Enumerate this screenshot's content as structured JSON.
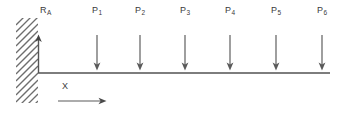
{
  "diagram": {
    "type": "cantilever-beam-free-body-diagram",
    "colors": {
      "line": "#7d7d7d",
      "hatch": "#6e6e6e",
      "arrow": "#666666",
      "text": "#3a3a3a",
      "background": "#ffffff"
    },
    "beam": {
      "label": "beam",
      "x_start": 38,
      "x_end": 330,
      "y": 73,
      "thickness": 2
    },
    "support": {
      "label": "fixed-support",
      "x": 16,
      "y_top": 18,
      "y_bottom": 103,
      "width": 22,
      "hatch_angle_deg": 45,
      "hatch_spacing": 7
    },
    "reaction": {
      "name": "R_A",
      "label_main": "R",
      "label_sub": "A",
      "x": 38,
      "label_x": 40,
      "label_y": 11,
      "arrow_tail_y": 73,
      "arrow_head_y": 37,
      "direction": "up"
    },
    "axis": {
      "name": "x-axis",
      "label": "X",
      "label_x": 62,
      "label_y": 82,
      "arrow_y": 101,
      "arrow_x_start": 58,
      "arrow_x_end": 106,
      "direction": "right"
    },
    "loads": [
      {
        "label_main": "P",
        "label_sub": "1",
        "x": 97,
        "label_x": 97,
        "label_y": 11,
        "arrow_top_y": 35,
        "arrow_bottom_y": 70,
        "direction": "down"
      },
      {
        "label_main": "P",
        "label_sub": "2",
        "x": 140,
        "label_x": 140,
        "label_y": 11,
        "arrow_top_y": 35,
        "arrow_bottom_y": 70,
        "direction": "down"
      },
      {
        "label_main": "P",
        "label_sub": "3",
        "x": 185,
        "label_x": 185,
        "label_y": 11,
        "arrow_top_y": 35,
        "arrow_bottom_y": 70,
        "direction": "down"
      },
      {
        "label_main": "P",
        "label_sub": "4",
        "x": 230,
        "label_x": 230,
        "label_y": 11,
        "arrow_top_y": 35,
        "arrow_bottom_y": 70,
        "direction": "down"
      },
      {
        "label_main": "P",
        "label_sub": "5",
        "x": 276,
        "label_x": 276,
        "label_y": 11,
        "arrow_top_y": 35,
        "arrow_bottom_y": 70,
        "direction": "down"
      },
      {
        "label_main": "P",
        "label_sub": "6",
        "x": 322,
        "label_x": 322,
        "label_y": 11,
        "arrow_top_y": 35,
        "arrow_bottom_y": 70,
        "direction": "down"
      }
    ]
  }
}
